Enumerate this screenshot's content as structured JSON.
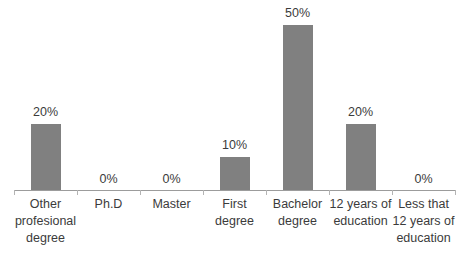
{
  "chart_data": {
    "type": "bar",
    "title": "",
    "subtitle": "",
    "xlabel": "",
    "ylabel": "",
    "ylim": [
      0,
      55
    ],
    "grid": false,
    "legend": false,
    "axis_visible": {
      "x": true,
      "y": false
    },
    "bar_color": "#808080",
    "text_color": "#3b3b3b",
    "axis_color": "#9c9c9c",
    "categories": [
      "Other profesional degree",
      "Ph.D",
      "Master",
      "First degree",
      "Bachelor degree",
      "12 years of education",
      "Less that 12 years of education"
    ],
    "values": [
      20,
      0,
      0,
      10,
      50,
      20,
      0
    ],
    "data_labels": [
      "20%",
      "0%",
      "0%",
      "10%",
      "50%",
      "20%",
      "0%"
    ]
  }
}
